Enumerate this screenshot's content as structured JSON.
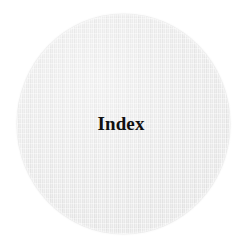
{
  "page": {
    "background_color": "#ffffff",
    "width": 245,
    "height": 250
  },
  "divider": {
    "shape": "circle",
    "fill_color": "#e9e9e9",
    "texture": "halftone-scan",
    "label": "Index",
    "label_color": "#111111",
    "label_style": "serif-bold"
  }
}
